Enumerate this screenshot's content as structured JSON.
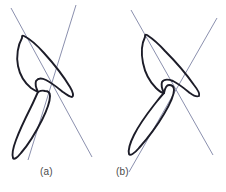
{
  "figure": {
    "title": "",
    "background_color": "#ffffff",
    "width": 226,
    "height": 192,
    "outline_color": "#1c1c28",
    "axis_color": "#8b90ae",
    "caption_color": "#4a4a4a"
  },
  "panels": [
    {
      "id": "a",
      "caption": "(a)",
      "shapes": [
        {
          "name": "upper-leaf-outline",
          "type": "closed-curve",
          "path": "M 22 38 C 18 45 16 56 18 66 C 20 76 25 83 31 88 C 34 90 36 91 38 92 C 36 88 35 84 36 81 C 38 78 42 78 46 80 C 52 83 58 88 63 92 C 67 95 70 97 72 97 C 74 96 73 92 70 87 C 64 77 54 64 44 53 C 36 44 28 38 24 36 C 22 35 22 36 22 38 Z"
        },
        {
          "name": "lower-leaf-outline",
          "type": "closed-curve",
          "path": "M 38 92 C 36 96 34 101 31 107 C 26 117 20 129 16 140 C 13 148 12 155 13 158 C 14 160 17 158 21 153 C 28 145 36 132 42 120 C 47 110 50 101 50 96 C 50 93 48 91 45 91 C 42 90 40 91 38 92 Z"
        }
      ],
      "axes": [
        {
          "name": "major-axis-line",
          "type": "line",
          "x1": 11,
          "y1": 8,
          "x2": 92,
          "y2": 157
        },
        {
          "name": "minor-axis-line",
          "type": "line",
          "x1": 76,
          "y1": 5,
          "x2": 28,
          "y2": 160
        }
      ]
    },
    {
      "id": "b",
      "caption": "(b)",
      "shapes": [
        {
          "name": "upper-leaf-outline",
          "type": "closed-curve",
          "path": "M 32 37 C 29 43 28 53 30 63 C 32 73 37 82 43 88 C 46 91 49 93 51 93 C 49 89 48 85 49 82 C 51 79 55 79 60 81 C 66 84 72 89 77 93 C 81 96 84 97 86 96 C 87 94 85 90 81 85 C 74 75 63 62 52 51 C 44 42 37 37 34 35 C 32 34 32 35 32 37 Z"
        },
        {
          "name": "lower-leaf-outline",
          "type": "closed-curve",
          "path": "M 51 93 C 48 96 45 100 41 105 C 34 114 26 125 21 135 C 17 143 15 150 16 154 C 17 156 21 154 26 148 C 34 139 44 126 51 114 C 57 104 61 95 61 90 C 61 87 59 85 56 85 C 54 85 52 88 51 93 Z"
        }
      ],
      "axes": [
        {
          "name": "major-axis-line",
          "type": "line",
          "x1": 18,
          "y1": 10,
          "x2": 100,
          "y2": 155
        },
        {
          "name": "minor-axis-line",
          "type": "line",
          "x1": 104,
          "y1": 18,
          "x2": 16,
          "y2": 172
        }
      ]
    }
  ]
}
